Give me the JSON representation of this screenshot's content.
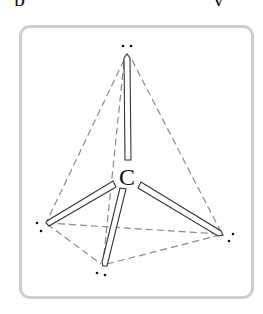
{
  "header": {
    "clipped_text_left": "p",
    "clipped_text_right": "y"
  },
  "diagram": {
    "title": "Tetrahedral arrangement of electron pairs around carbon",
    "central_atom": "C",
    "vertices": [
      {
        "name": "top",
        "x": 127,
        "y": 55,
        "lone_pair": [
          [
            123,
            46
          ],
          [
            131,
            46
          ]
        ]
      },
      {
        "name": "left",
        "x": 46,
        "y": 223,
        "lone_pair": [
          [
            37,
            223
          ],
          [
            41,
            231
          ]
        ]
      },
      {
        "name": "right",
        "x": 222,
        "y": 234,
        "lone_pair": [
          [
            233,
            234
          ],
          [
            229,
            241
          ]
        ]
      },
      {
        "name": "bottom",
        "x": 103,
        "y": 266,
        "lone_pair": [
          [
            97,
            273
          ],
          [
            105,
            276
          ]
        ]
      }
    ],
    "center": {
      "x": 128,
      "y": 178
    },
    "colors": {
      "bond": "#333333",
      "dashed_edge": "#8a8a8a",
      "frame_border": "#cfcfcf",
      "dots": "#111111"
    }
  }
}
